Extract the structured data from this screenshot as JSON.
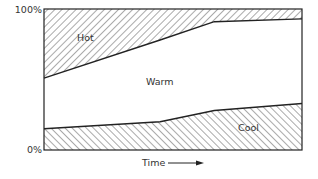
{
  "chart_data": {
    "type": "area",
    "stacked": true,
    "normalized": true,
    "title": "",
    "xlabel": "Time",
    "ylabel": "",
    "x": [
      0,
      45,
      66,
      100
    ],
    "ylim": [
      0,
      100
    ],
    "yticks": [
      "0%",
      "100%"
    ],
    "grid": false,
    "legend": "inline labels",
    "series": [
      {
        "name": "Cool",
        "values": [
          15,
          20,
          28,
          33
        ],
        "fill": "hatched (\\\\)"
      },
      {
        "name": "Warm",
        "values": [
          36,
          58,
          63,
          60
        ],
        "fill": "white"
      },
      {
        "name": "Hot",
        "values": [
          49,
          22,
          9,
          7
        ],
        "fill": "hatched (//)"
      }
    ],
    "boundaries": {
      "cool_warm": [
        15,
        20,
        28,
        33
      ],
      "warm_hot": [
        51,
        78,
        91,
        93
      ]
    }
  },
  "labels": {
    "y_top": "100%",
    "y_bottom": "0%",
    "x_axis": "Time",
    "hot": "Hot",
    "warm": "Warm",
    "cool": "Cool"
  },
  "colors": {
    "line": "#222222",
    "hatch": "#555555",
    "background": "#ffffff"
  }
}
